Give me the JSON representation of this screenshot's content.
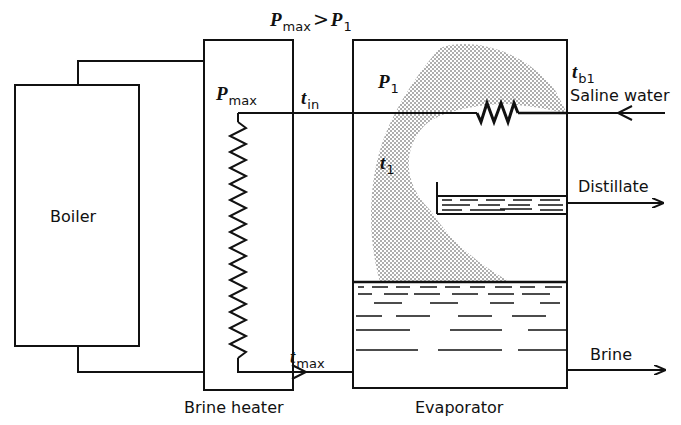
{
  "diagram": {
    "components": {
      "boiler": {
        "label": "Boiler"
      },
      "brine_heater": {
        "label": "Brine heater"
      },
      "evaporator": {
        "label": "Evaporator"
      }
    },
    "streams": {
      "saline_water": {
        "label": "Saline water",
        "direction": "in"
      },
      "distillate": {
        "label": "Distillate",
        "direction": "out"
      },
      "brine": {
        "label": "Brine",
        "direction": "out"
      }
    },
    "symbols": {
      "pressure_relation": {
        "lhs": "P",
        "lhs_sub": "max",
        "op": ">",
        "rhs": "P",
        "rhs_sub": "1"
      },
      "p_max": {
        "main": "P",
        "sub": "max"
      },
      "p_1": {
        "main": "P",
        "sub": "1"
      },
      "t_in": {
        "main": "t",
        "sub": "in"
      },
      "t_1": {
        "main": "t",
        "sub": "1"
      },
      "t_b1": {
        "main": "t",
        "sub": "b1"
      },
      "t_max": {
        "main": "t",
        "sub": "max"
      }
    },
    "colors": {
      "line": "#111111",
      "background": "#ffffff",
      "stipple": "#333333"
    }
  }
}
